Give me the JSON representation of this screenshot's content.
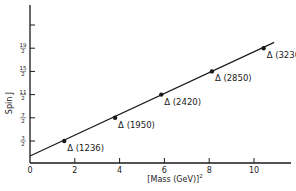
{
  "chart_data": {
    "type": "scatter",
    "title": "",
    "xlabel": "[Mass (GeV)]",
    "xlabel_superscript": "2",
    "ylabel": "Spin J",
    "xlim": [
      0,
      11.5
    ],
    "ylim": [
      0,
      12
    ],
    "grid": false,
    "legend": null,
    "x_ticks": [
      "0",
      "2",
      "4",
      "6",
      "8",
      "10"
    ],
    "x_tick_values": [
      0,
      2,
      4,
      6,
      8,
      10
    ],
    "y_ticks": [
      {
        "num": "3",
        "den": "2",
        "value": 1.5
      },
      {
        "num": "7",
        "den": "2",
        "value": 3.5
      },
      {
        "num": "11",
        "den": "2",
        "value": 5.5
      },
      {
        "num": "15",
        "den": "2",
        "value": 7.5
      },
      {
        "num": "19",
        "den": "2",
        "value": 9.5
      },
      {
        "num": "",
        "den": "",
        "value": 11.5
      }
    ],
    "series": [
      {
        "name": "Delta resonances",
        "points": [
          {
            "label": "Δ (1236)",
            "x": 1.53,
            "y": 1.5
          },
          {
            "label": "Δ (1950)",
            "x": 3.8,
            "y": 3.5
          },
          {
            "label": "Δ (2420)",
            "x": 5.86,
            "y": 5.5
          },
          {
            "label": "Δ (2850)",
            "x": 8.12,
            "y": 7.5
          },
          {
            "label": "Δ (3230)",
            "x": 10.43,
            "y": 9.5
          }
        ]
      }
    ],
    "fit_line": {
      "x_start": 0,
      "y_start": 0.2,
      "x_end": 10.9,
      "y_end": 10.0
    }
  }
}
